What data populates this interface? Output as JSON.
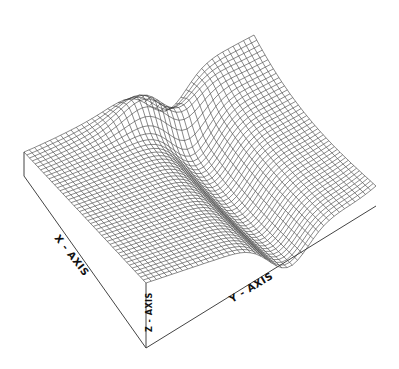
{
  "figure": {
    "type": "3d-surface-wireframe",
    "background": "#ffffff",
    "line_color": "#3a3a3a",
    "box_color": "#444444",
    "grid": {
      "nx": 44,
      "ny": 44
    }
  },
  "labels": {
    "x_axis": "X - AXIS",
    "y_axis": "Y - AXIS",
    "z_axis": "Z - AXIS"
  },
  "chart_data": {
    "type": "surface",
    "title": "",
    "xlabel": "X - AXIS",
    "ylabel": "Y - AXIS",
    "zlabel": "Z - AXIS",
    "grid_resolution": [
      44,
      44
    ],
    "ticks": "none shown"
  }
}
